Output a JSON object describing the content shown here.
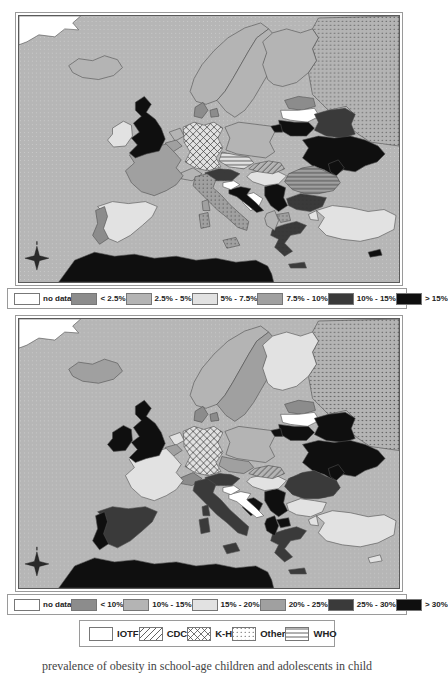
{
  "palette": {
    "sea": "#b6b6b6",
    "sea_dot": "#c9c9c9",
    "country_border": "#4f4f4f",
    "classes": [
      "#ffffff",
      "#8c8c8c",
      "#b4b4b4",
      "#e2e2e2",
      "#a0a0a0",
      "#3a3a3a",
      "#0f0f0f"
    ]
  },
  "maps": [
    {
      "name": "map-top",
      "legend": [
        "no data",
        "< 2.5%",
        "2.5% - 5%",
        "5% - 7.5%",
        "7.5% - 10%",
        "10% - 15%",
        "> 15%"
      ],
      "countries": {
        "greenland": {
          "class": 0
        },
        "iceland": {
          "class": 2
        },
        "ireland": {
          "class": 3
        },
        "uk": {
          "class": 6
        },
        "portugal": {
          "class": 1
        },
        "spain": {
          "class": 3
        },
        "france": {
          "class": 4
        },
        "belgium": {
          "class": 4
        },
        "netherlands": {
          "class": 2
        },
        "germany": {
          "class": 3,
          "pattern": "cross"
        },
        "denmark": {
          "class": 1
        },
        "switzerland": {
          "class": 2
        },
        "austria": {
          "class": 5,
          "pattern": "cross"
        },
        "italy": {
          "class": 4,
          "pattern": "dots"
        },
        "norway": {
          "class": 2
        },
        "sweden": {
          "class": 2
        },
        "finland": {
          "class": 2
        },
        "estonia": {
          "class": 1
        },
        "latvia": {
          "class": 0
        },
        "lithuania": {
          "class": 6
        },
        "kaliningrad": {
          "class": 6
        },
        "poland": {
          "class": 2
        },
        "belarus": {
          "class": 5,
          "pattern": "diag"
        },
        "ukraine": {
          "class": 6
        },
        "moldova": {
          "class": 6
        },
        "romania": {
          "class": 4,
          "pattern": "hlines"
        },
        "hungary": {
          "class": 3
        },
        "slovakia": {
          "class": 2,
          "pattern": "diag"
        },
        "czech": {
          "class": 3,
          "pattern": "hlines"
        },
        "slovenia": {
          "class": 0
        },
        "croatia": {
          "class": 6
        },
        "bosnia": {
          "class": 0
        },
        "serbia": {
          "class": 6
        },
        "albania": {
          "class": 2
        },
        "macedonia": {
          "class": 4,
          "pattern": "dots"
        },
        "greece": {
          "class": 5,
          "pattern": "dots"
        },
        "bulgaria": {
          "class": 5,
          "pattern": "dots"
        },
        "turkey": {
          "class": 3
        },
        "russia": {
          "class": 2,
          "pattern": "dots"
        },
        "africa": {
          "class": 6
        },
        "corsica": {
          "class": 4
        },
        "sardinia": {
          "class": 4,
          "pattern": "dots"
        },
        "sicily": {
          "class": 4,
          "pattern": "dots"
        },
        "crete": {
          "class": 5
        },
        "cyprus": {
          "class": 6
        }
      }
    },
    {
      "name": "map-bottom",
      "legend": [
        "no data",
        "< 10%",
        "10% - 15%",
        "15% - 20%",
        "20% - 25%",
        "25% - 30%",
        "> 30%"
      ],
      "countries": {
        "greenland": {
          "class": 0
        },
        "iceland": {
          "class": 4
        },
        "ireland": {
          "class": 6
        },
        "uk": {
          "class": 6
        },
        "portugal": {
          "class": 6
        },
        "spain": {
          "class": 5
        },
        "france": {
          "class": 3
        },
        "belgium": {
          "class": 4
        },
        "netherlands": {
          "class": 3
        },
        "germany": {
          "class": 3,
          "pattern": "cross"
        },
        "denmark": {
          "class": 1
        },
        "switzerland": {
          "class": 1
        },
        "austria": {
          "class": 5,
          "pattern": "cross"
        },
        "italy": {
          "class": 5
        },
        "norway": {
          "class": 2
        },
        "sweden": {
          "class": 4
        },
        "finland": {
          "class": 3
        },
        "estonia": {
          "class": 1
        },
        "latvia": {
          "class": 0
        },
        "lithuania": {
          "class": 6
        },
        "kaliningrad": {
          "class": 6
        },
        "poland": {
          "class": 2
        },
        "belarus": {
          "class": 6
        },
        "ukraine": {
          "class": 6
        },
        "moldova": {
          "class": 6
        },
        "romania": {
          "class": 5,
          "pattern": "hlines"
        },
        "hungary": {
          "class": 3
        },
        "slovakia": {
          "class": 2,
          "pattern": "diag"
        },
        "czech": {
          "class": 4
        },
        "slovenia": {
          "class": 0
        },
        "croatia": {
          "class": 0
        },
        "bosnia": {
          "class": 6
        },
        "serbia": {
          "class": 6
        },
        "albania": {
          "class": 6
        },
        "macedonia": {
          "class": 6
        },
        "greece": {
          "class": 5
        },
        "bulgaria": {
          "class": 3
        },
        "turkey": {
          "class": 3
        },
        "russia": {
          "class": 2,
          "pattern": "dots"
        },
        "africa": {
          "class": 6
        },
        "corsica": {
          "class": 5
        },
        "sardinia": {
          "class": 5
        },
        "sicily": {
          "class": 5
        },
        "crete": {
          "class": 5
        },
        "cyprus": {
          "class": 3
        }
      }
    }
  ],
  "source_legend": [
    {
      "label": "IOTF",
      "pattern": "plain"
    },
    {
      "label": "CDC",
      "pattern": "diag"
    },
    {
      "label": "K-H",
      "pattern": "cross"
    },
    {
      "label": "Other",
      "pattern": "dots"
    },
    {
      "label": "WHO",
      "pattern": "hlines"
    }
  ],
  "caption": "prevalence of obesity in school-age children and adolescents in child"
}
